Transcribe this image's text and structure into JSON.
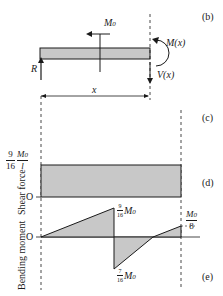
{
  "figure": {
    "panel_labels": {
      "b": "(b)",
      "c": "(c)",
      "d": "(d)",
      "e": "(e)"
    },
    "free_body": {
      "moment_label": "M",
      "moment_sub": "0",
      "reaction_label": "R",
      "internal_moment_label": "M(x)",
      "shear_label": "V(x)",
      "distance_label": "x"
    },
    "shear_diagram": {
      "axis_label": "Shear force",
      "origin_label": "O",
      "value_num": "9",
      "value_den": "16",
      "value_M": "M",
      "value_sub": "0",
      "value_over": "l"
    },
    "moment_diagram": {
      "axis_label": "Bending moment",
      "origin_label": "O",
      "peak_pos_num": "9",
      "peak_pos_den": "16",
      "peak_pos_M": "M",
      "peak_pos_sub": "0",
      "peak_neg_num": "7",
      "peak_neg_den": "16",
      "peak_neg_M": "M",
      "peak_neg_sub": "0",
      "end_M": "M",
      "end_sub": "0",
      "end_den": "8"
    },
    "colors": {
      "fill": "#c8c8c8",
      "stroke": "#1a1a1a",
      "background": "#ffffff"
    }
  }
}
